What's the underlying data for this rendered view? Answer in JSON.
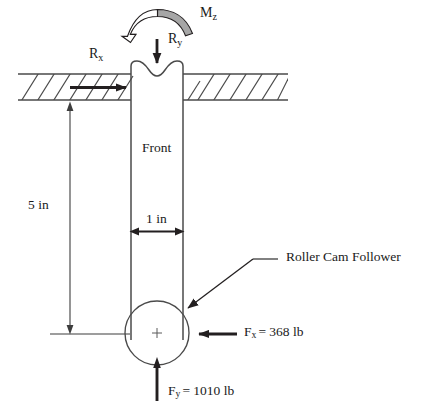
{
  "diagram": {
    "colors": {
      "line": "#231f20",
      "thin_line": "#4a4a4a",
      "moment_fill": "#a6a6a6",
      "moment_stroke": "#231f20",
      "background": "#ffffff",
      "text": "#1a1a1a"
    },
    "labels": {
      "moment": {
        "symbol": "M",
        "subscript": "z",
        "text": "Mz"
      },
      "reaction_y": {
        "symbol": "R",
        "subscript": "y",
        "text": "Ry"
      },
      "reaction_x": {
        "symbol": "R",
        "subscript": "x",
        "text": "Rx"
      },
      "front_face": "Front",
      "length_dimension": "5 in",
      "width_dimension": "1 in",
      "callout": "Roller Cam Follower",
      "force_x": {
        "symbol": "F",
        "subscript": "x",
        "value": "368",
        "unit": "lb",
        "text": "= 368 lb"
      },
      "force_y": {
        "symbol": "F",
        "subscript": "y",
        "value": "1010",
        "unit": "lb",
        "text": "= 1010 lb"
      }
    },
    "icon_names": [
      "moment-arc-arrow-icon",
      "down-arrow-icon",
      "right-arrow-icon",
      "left-arrow-icon",
      "up-arrow-icon",
      "double-headed-arrow-icon",
      "hatched-support-icon",
      "center-crosshair-icon",
      "leader-line-icon"
    ],
    "geometry": {
      "rod": {
        "left": 131,
        "right": 183,
        "top": 62,
        "bottom": 340,
        "width_in": 1
      },
      "support_band": {
        "top_y": 74,
        "bottom_y": 100,
        "left": 18,
        "right": 288
      },
      "roller": {
        "cx": 157,
        "cy": 333,
        "r": 32
      },
      "length_dimension": {
        "x": 70,
        "top_y": 103,
        "bottom_y": 334,
        "value_in": 5
      }
    }
  }
}
